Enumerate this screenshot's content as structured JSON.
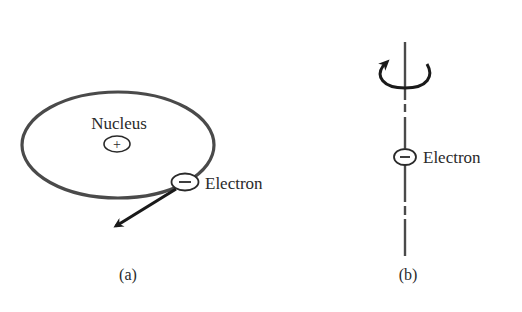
{
  "figure": {
    "panel_a": {
      "caption": "(a)",
      "nucleus_label": "Nucleus",
      "nucleus_charge": "+",
      "electron_label": "Electron",
      "electron_charge": "−",
      "elements": [
        "elliptical-orbit",
        "nucleus",
        "electron",
        "velocity-arrow"
      ]
    },
    "panel_b": {
      "caption": "(b)",
      "electron_label": "Electron",
      "electron_charge": "−",
      "elements": [
        "spin-axis",
        "rotation-arrow",
        "electron"
      ]
    },
    "colors": {
      "stroke": "#4a4a4a",
      "arrow": "#1a1a1a",
      "text": "#2a2a2a",
      "background": "#ffffff"
    }
  }
}
